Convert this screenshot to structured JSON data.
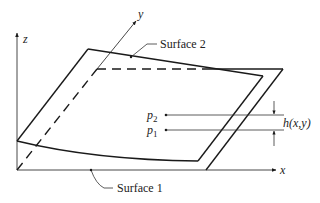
{
  "diagram": {
    "type": "two-surface gap geometry",
    "axes": {
      "x_label": "x",
      "y_label": "y",
      "z_label": "z"
    },
    "surfaces": [
      {
        "label": "Surface 1",
        "description": "flat lower plane"
      },
      {
        "label": "Surface 2",
        "description": "curved upper surface"
      }
    ],
    "points": [
      {
        "name": "p",
        "subscript": "2"
      },
      {
        "name": "p",
        "subscript": "1"
      }
    ],
    "gap_label": "h(x,y)",
    "colors": {
      "line": "#1a1a1a",
      "thin_line": "#333333",
      "background": "#ffffff"
    }
  }
}
